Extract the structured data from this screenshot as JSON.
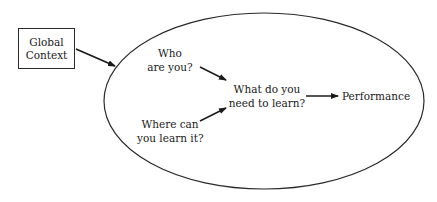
{
  "diagram": {
    "external_node": {
      "line1": "Global",
      "line2": "Context"
    },
    "container": {
      "shape": "ellipse"
    },
    "nodes": {
      "who": {
        "line1": "Who",
        "line2": "are you?"
      },
      "where": {
        "line1": "Where can",
        "line2": "you learn it?"
      },
      "what": {
        "line1": "What do you",
        "line2": "need to learn?"
      },
      "performance": {
        "label": "Performance"
      }
    },
    "edges": [
      {
        "from": "Global Context",
        "to": "ellipse"
      },
      {
        "from": "Who are you?",
        "to": "What do you need to learn?"
      },
      {
        "from": "Where can you learn it?",
        "to": "What do you need to learn?"
      },
      {
        "from": "What do you need to learn?",
        "to": "Performance"
      }
    ],
    "colors": {
      "stroke": "#2a2a2a",
      "text": "#1a1a1a",
      "background": "#ffffff"
    }
  }
}
